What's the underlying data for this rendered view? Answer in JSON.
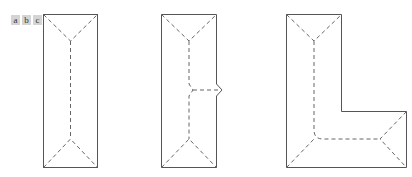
{
  "labels": [
    "a",
    "b",
    "c"
  ],
  "colors": {
    "edge": "#555555",
    "ridge": "#666666",
    "label_bg": "#d4d4d4"
  },
  "figures": [
    {
      "id": "a",
      "shape": "rectangle hip roof"
    },
    {
      "id": "b",
      "shape": "rectangle hip roof with side dormer"
    },
    {
      "id": "c",
      "shape": "L-shaped hip roof"
    }
  ]
}
